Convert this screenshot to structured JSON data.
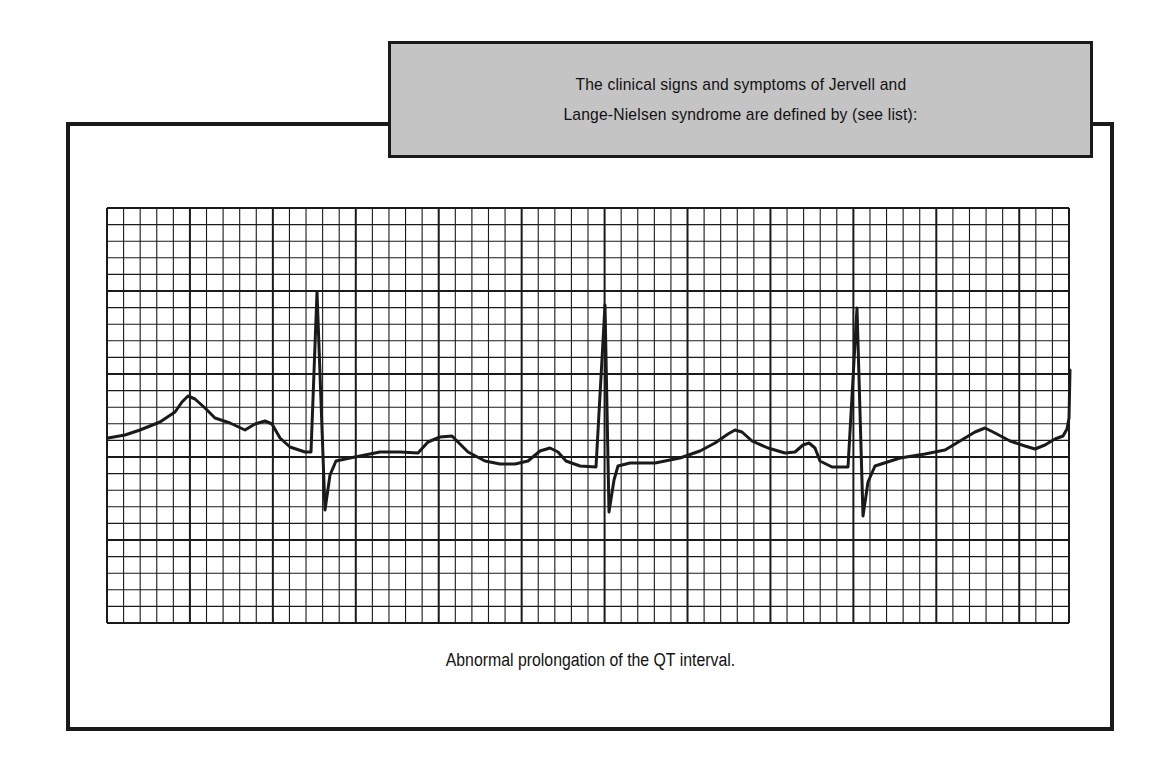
{
  "header": {
    "line1": "The clinical signs and symptoms of Jervell and",
    "line2": "Lange-Nielsen syndrome are defined by (see list):"
  },
  "caption": "Abnormal prolongation of the QT interval.",
  "colors": {
    "header_fill": "#c4c4c4",
    "line": "#1a1a1a",
    "background": "#ffffff"
  },
  "ecg": {
    "grid": {
      "left": 107,
      "top": 208,
      "width": 962,
      "height": 415,
      "cols": 58,
      "rows": 25,
      "major_every": 5
    },
    "trace_points": [
      [
        108,
        438
      ],
      [
        125,
        435
      ],
      [
        140,
        430
      ],
      [
        160,
        422
      ],
      [
        175,
        412
      ],
      [
        182,
        402
      ],
      [
        188,
        396
      ],
      [
        195,
        399
      ],
      [
        205,
        408
      ],
      [
        215,
        418
      ],
      [
        230,
        423
      ],
      [
        245,
        430
      ],
      [
        255,
        424
      ],
      [
        265,
        421
      ],
      [
        272,
        424
      ],
      [
        280,
        438
      ],
      [
        290,
        447
      ],
      [
        305,
        452
      ],
      [
        311,
        452
      ],
      [
        317,
        292
      ],
      [
        325,
        510
      ],
      [
        330,
        475
      ],
      [
        336,
        461
      ],
      [
        350,
        458
      ],
      [
        365,
        455
      ],
      [
        380,
        452
      ],
      [
        400,
        452
      ],
      [
        418,
        453
      ],
      [
        428,
        442
      ],
      [
        440,
        437
      ],
      [
        452,
        436
      ],
      [
        460,
        444
      ],
      [
        468,
        452
      ],
      [
        485,
        461
      ],
      [
        500,
        464
      ],
      [
        515,
        464
      ],
      [
        528,
        461
      ],
      [
        540,
        451
      ],
      [
        550,
        448
      ],
      [
        558,
        452
      ],
      [
        566,
        461
      ],
      [
        580,
        466
      ],
      [
        596,
        467
      ],
      [
        605,
        305
      ],
      [
        609,
        512
      ],
      [
        614,
        480
      ],
      [
        618,
        466
      ],
      [
        630,
        463
      ],
      [
        655,
        463
      ],
      [
        680,
        458
      ],
      [
        700,
        451
      ],
      [
        715,
        443
      ],
      [
        728,
        434
      ],
      [
        735,
        430
      ],
      [
        742,
        432
      ],
      [
        752,
        441
      ],
      [
        768,
        448
      ],
      [
        785,
        453
      ],
      [
        795,
        452
      ],
      [
        803,
        445
      ],
      [
        809,
        443
      ],
      [
        815,
        448
      ],
      [
        820,
        461
      ],
      [
        832,
        467
      ],
      [
        848,
        467
      ],
      [
        857,
        308
      ],
      [
        863,
        516
      ],
      [
        868,
        482
      ],
      [
        875,
        466
      ],
      [
        900,
        458
      ],
      [
        925,
        454
      ],
      [
        945,
        450
      ],
      [
        960,
        441
      ],
      [
        975,
        432
      ],
      [
        985,
        428
      ],
      [
        995,
        433
      ],
      [
        1010,
        441
      ],
      [
        1025,
        446
      ],
      [
        1035,
        449
      ],
      [
        1045,
        445
      ],
      [
        1055,
        439
      ],
      [
        1063,
        436
      ],
      [
        1067,
        429
      ],
      [
        1069,
        418
      ],
      [
        1070,
        370
      ]
    ]
  }
}
